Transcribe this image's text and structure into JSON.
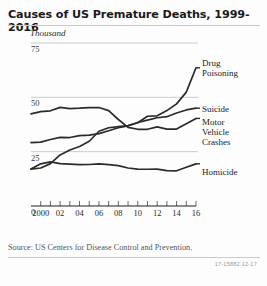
{
  "chart_data": {
    "type": "line",
    "title": "Causes of US Premature Deaths, 1999-2016",
    "unit_label": "Thousand",
    "xlabel": "",
    "ylabel": "",
    "ylim": [
      0,
      75
    ],
    "xlim": [
      1999,
      2016
    ],
    "grid": true,
    "gridlines": [
      25,
      50,
      75
    ],
    "legend_position": "right-inline",
    "yticks": [
      0,
      25,
      50,
      75
    ],
    "ytick_labels": [
      "0",
      "25",
      "50",
      "75"
    ],
    "x": [
      1999,
      2000,
      2001,
      2002,
      2003,
      2004,
      2005,
      2006,
      2007,
      2008,
      2009,
      2010,
      2011,
      2012,
      2013,
      2014,
      2015,
      2016
    ],
    "xtick_values": [
      2000,
      2002,
      2004,
      2006,
      2008,
      2010,
      2012,
      2014,
      2016
    ],
    "xtick_labels": [
      "2000",
      "02",
      "04",
      "06",
      "08",
      "10",
      "12",
      "14",
      "16"
    ],
    "series": [
      {
        "name": "Drug Poisoning",
        "color": "#2b2b2b",
        "values": [
          17.0,
          17.5,
          19.5,
          23.5,
          25.8,
          27.4,
          29.8,
          34.4,
          36.0,
          36.5,
          37.0,
          38.3,
          41.3,
          41.5,
          43.9,
          47.0,
          52.4,
          63.6
        ]
      },
      {
        "name": "Suicide",
        "color": "#2b2b2b",
        "values": [
          29.2,
          29.4,
          30.6,
          31.6,
          31.5,
          32.4,
          32.6,
          33.3,
          34.6,
          36.0,
          36.9,
          38.4,
          39.5,
          40.6,
          41.1,
          42.8,
          44.2,
          45.0
        ]
      },
      {
        "name": "Motor Vehicle Crashes",
        "color": "#2b2b2b",
        "values": [
          42.4,
          43.4,
          43.8,
          45.4,
          44.8,
          45.0,
          45.3,
          45.3,
          43.9,
          39.8,
          36.2,
          35.3,
          35.3,
          36.4,
          35.4,
          35.4,
          37.8,
          40.3
        ]
      },
      {
        "name": "Homicide",
        "color": "#2b2b2b",
        "values": [
          17.0,
          19.4,
          20.3,
          19.5,
          19.3,
          19.0,
          19.1,
          19.4,
          19.0,
          18.6,
          17.5,
          17.0,
          16.9,
          17.0,
          16.3,
          16.2,
          17.8,
          19.4
        ]
      }
    ],
    "series_labels": [
      {
        "text": "Drug\nPoisoning",
        "left": 202,
        "top": 58
      },
      {
        "text": "Suicide",
        "left": 202,
        "top": 104
      },
      {
        "text": "Motor\nVehicle\nCrashes",
        "left": 202,
        "top": 117
      },
      {
        "text": "Homicide",
        "left": 202,
        "top": 167
      }
    ]
  },
  "footer": {
    "source": "Source: US Centers for Disease Control and Prevention.",
    "figure_code": "17-15882 12-17"
  }
}
